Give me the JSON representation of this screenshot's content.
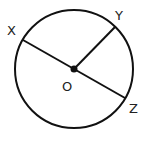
{
  "diagram": {
    "type": "circle-geometry",
    "circle": {
      "center": [
        74,
        69
      ],
      "radius": 59,
      "stroke": "#111111"
    },
    "center_point": {
      "label": "O",
      "x": 74,
      "y": 69
    },
    "points": [
      {
        "label": "X",
        "x": 21,
        "y": 40
      },
      {
        "label": "Y",
        "x": 115,
        "y": 27
      },
      {
        "label": "Z",
        "x": 125,
        "y": 98
      }
    ],
    "segments": [
      {
        "from": "X",
        "to": "Z",
        "kind": "diameter"
      },
      {
        "from": "O",
        "to": "Y",
        "kind": "radius"
      }
    ],
    "labels": {
      "x": "X",
      "y": "Y",
      "z": "Z",
      "o": "O"
    }
  }
}
